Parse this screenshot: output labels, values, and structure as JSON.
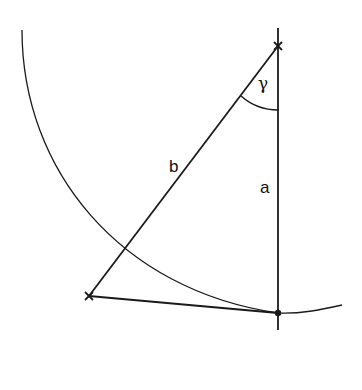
{
  "diagram": {
    "labels": {
      "side_a": "a",
      "side_b": "b",
      "angle": "γ"
    },
    "points": {
      "top": {
        "x": 278,
        "y": 46,
        "marker": "cross"
      },
      "left": {
        "x": 89,
        "y": 296,
        "marker": "cross"
      },
      "bottom": {
        "x": 278,
        "y": 313,
        "marker": "dot"
      }
    },
    "colors": {
      "stroke": "#1a1a1a",
      "background": "#ffffff"
    }
  }
}
